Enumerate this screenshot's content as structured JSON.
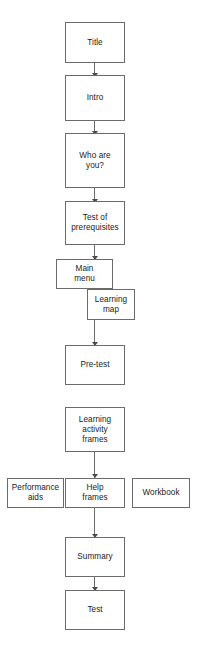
{
  "diagram": {
    "type": "flowchart",
    "orientation": "vertical",
    "background_color": "#ffffff",
    "box_border_color": "#6b6b6b",
    "connector_color": "#6b6b6b",
    "text_color": "#1a1a1a",
    "nodes": [
      {
        "id": "title",
        "label": "Title"
      },
      {
        "id": "intro",
        "label": "Intro"
      },
      {
        "id": "who_are_you",
        "label": "Who are\nyou?"
      },
      {
        "id": "test_prereq",
        "label": "Test of\nprerequisites"
      },
      {
        "id": "main_menu",
        "label": "Main\nmenu"
      },
      {
        "id": "learning_map",
        "label": "Learning\nmap"
      },
      {
        "id": "pre_test",
        "label": "Pre-test"
      },
      {
        "id": "learning_frames",
        "label": "Learning\nactivity\nframes"
      },
      {
        "id": "performance_aids",
        "label": "Performance\naids"
      },
      {
        "id": "help_frames",
        "label": "Help\nframes"
      },
      {
        "id": "workbook",
        "label": "Workbook"
      },
      {
        "id": "summary",
        "label": "Summary"
      },
      {
        "id": "test",
        "label": "Test"
      }
    ],
    "connectors": [
      {
        "from": "title",
        "to": "intro",
        "arrow": true
      },
      {
        "from": "intro",
        "to": "who_are_you",
        "arrow": true
      },
      {
        "from": "who_are_you",
        "to": "test_prereq",
        "arrow": true
      },
      {
        "from": "test_prereq",
        "to": "main_menu",
        "arrow": true
      },
      {
        "from": "learning_map",
        "to": "pre_test",
        "arrow": true
      },
      {
        "from": "learning_frames",
        "to": "help_frames",
        "arrow": true
      },
      {
        "from": "help_frames",
        "to": "summary",
        "arrow": true
      },
      {
        "from": "summary",
        "to": "test",
        "arrow": true
      }
    ]
  }
}
